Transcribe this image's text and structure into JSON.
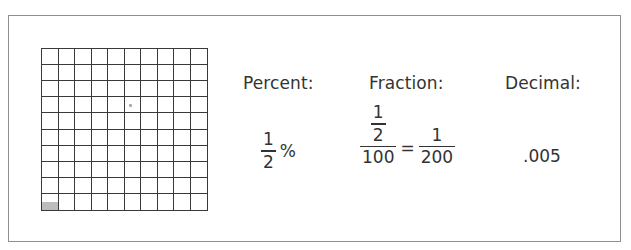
{
  "figure": {
    "grid": {
      "rows": 10,
      "columns": 10,
      "shaded_cell": {
        "row": 10,
        "column": 1,
        "portion": "half"
      },
      "shade_color": "#bdbdbd",
      "line_color": "#3a3a3a"
    },
    "headers": {
      "percent": "Percent:",
      "fraction": "Fraction:",
      "decimal": "Decimal:"
    },
    "percent": {
      "numerator": "1",
      "denominator": "2",
      "symbol": "%"
    },
    "fraction": {
      "inner_numerator": "1",
      "inner_denominator": "2",
      "outer_denominator": "100",
      "equals": "=",
      "result_numerator": "1",
      "result_denominator": "200"
    },
    "decimal": {
      "value": ".005"
    }
  }
}
